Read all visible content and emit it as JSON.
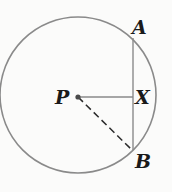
{
  "diagram": {
    "type": "geometry",
    "colors": {
      "stroke": "#8a8a8a",
      "text": "#1a1a1a",
      "background": "#fbfbfa"
    },
    "circle": {
      "center_label": "P",
      "cx": 78,
      "cy": 95,
      "r": 78
    },
    "points": [
      {
        "label": "A",
        "x": 133,
        "y": 38
      },
      {
        "label": "X",
        "x": 133,
        "y": 97
      },
      {
        "label": "B",
        "x": 133,
        "y": 150
      },
      {
        "label": "P",
        "x": 78,
        "y": 97
      }
    ],
    "segments": [
      {
        "from": "A",
        "to": "B",
        "style": "solid"
      },
      {
        "from": "P",
        "to": "X",
        "style": "solid"
      },
      {
        "from": "P",
        "to": "B",
        "style": "dashed"
      }
    ],
    "labels": {
      "A": "A",
      "X": "X",
      "B": "B",
      "P": "P"
    }
  }
}
